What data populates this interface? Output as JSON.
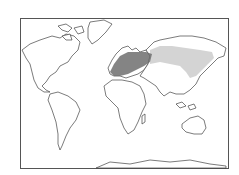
{
  "map": {
    "projection": "world-mercator-outline",
    "frame": {
      "x": 20,
      "y": 18,
      "width": 209,
      "height": 151
    },
    "colors": {
      "land_fill": "#ffffff",
      "coast_stroke": "#444444",
      "range_dense": "#6e6e6e",
      "range_sparse": "#cfcfcf",
      "frame_border": "#555555"
    },
    "regions": [
      {
        "name": "western-europe-range",
        "shade": "dense"
      },
      {
        "name": "siberia-east-asia-range",
        "shade": "sparse"
      }
    ]
  }
}
